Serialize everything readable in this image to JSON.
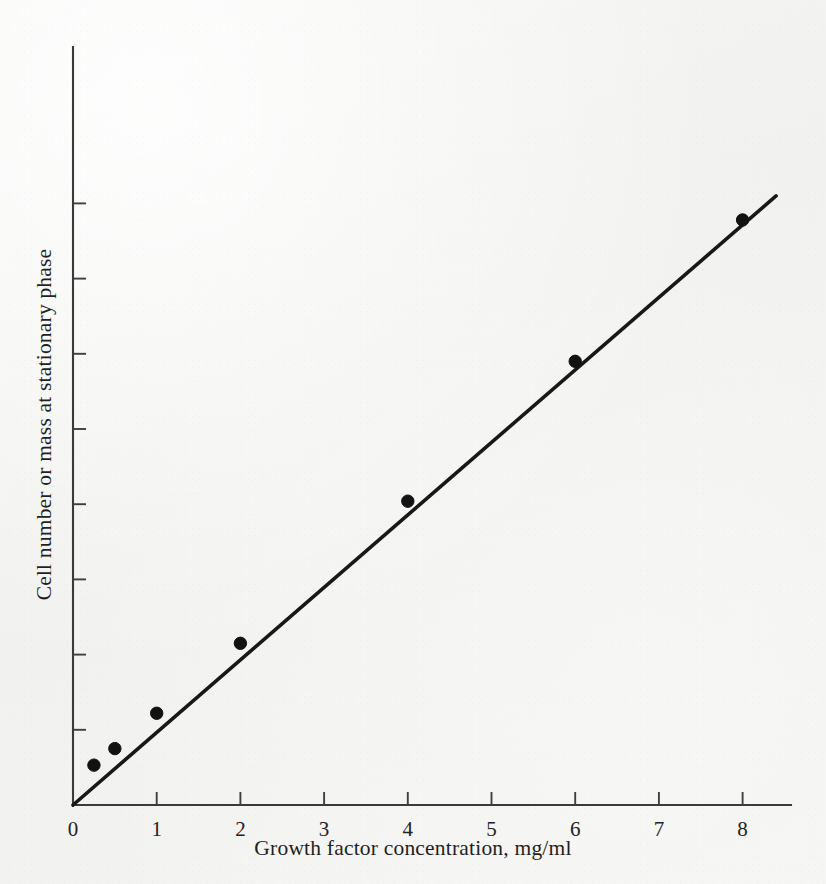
{
  "figure": {
    "background_color": "#f4f4f2",
    "ink_color": "#181818",
    "x_axis_title": "Growth factor concentration, mg/ml",
    "y_axis_title": "Cell number or mass at stationary phase"
  },
  "chart_data": {
    "type": "line",
    "title": "",
    "xlabel": "Growth factor concentration, mg/ml",
    "ylabel": "Cell number or mass at stationary phase",
    "xlim": [
      0,
      8.55
    ],
    "ylim": [
      0,
      8.05
    ],
    "grid": false,
    "legend": null,
    "x_tick_labels": [
      "0",
      "1",
      "2",
      "3",
      "4",
      "5",
      "6",
      "7",
      "8"
    ],
    "x_ticks": [
      0,
      1,
      2,
      3,
      4,
      5,
      6,
      7,
      8
    ],
    "y_ticks": [
      1,
      2,
      3,
      4,
      5,
      6,
      7,
      8
    ],
    "y_tick_labels": [
      "",
      "",
      "",
      "",
      "",
      "",
      "",
      ""
    ],
    "y_axis_note": "unlabeled tick marks, arbitrary units",
    "x": [
      0.25,
      0.5,
      1,
      2,
      4,
      6,
      8
    ],
    "y": [
      0.53,
      0.75,
      1.22,
      2.15,
      4.04,
      5.9,
      7.78
    ],
    "points": [
      {
        "x": 0.25,
        "y": 0.53
      },
      {
        "x": 0.5,
        "y": 0.75
      },
      {
        "x": 1,
        "y": 1.22
      },
      {
        "x": 2,
        "y": 2.15
      },
      {
        "x": 4,
        "y": 4.04
      },
      {
        "x": 6,
        "y": 5.9
      },
      {
        "x": 8,
        "y": 7.78
      }
    ],
    "line": {
      "from": {
        "x": 0,
        "y": 0
      },
      "to": {
        "x": 8.4,
        "y": 8.1
      },
      "style": "solid",
      "marker": "filled-circle",
      "relationship": "linear proportional increase through origin"
    },
    "annotations": []
  }
}
